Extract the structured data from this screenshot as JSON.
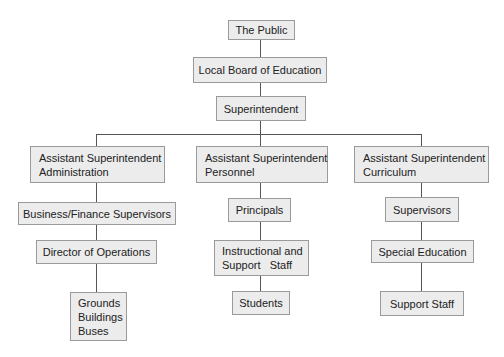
{
  "chart": {
    "title": "",
    "nodes": {
      "public": "The Public",
      "board": "Local Board of Education",
      "superintendent": "Superintendent",
      "asst_admin": {
        "line1": "Assistant Superintendent",
        "line2": "Administration"
      },
      "asst_personnel": {
        "line1": "Assistant Superintendent",
        "line2": "Personnel"
      },
      "asst_curriculum": {
        "line1": "Assistant Superintendent",
        "line2": "Curriculum"
      },
      "business_finance": "Business/Finance Supervisors",
      "director_operations": "Director of Operations",
      "grounds": {
        "line1": "Grounds",
        "line2": "Buildings",
        "line3": "Buses"
      },
      "principals": "Principals",
      "instructional": {
        "line1": "Instructional and",
        "line2": "Support   Staff"
      },
      "students": "Students",
      "supervisors": "Supervisors",
      "special_education": "Special Education",
      "support_staff": "Support Staff"
    },
    "colors": {
      "box_fill": "#ececec",
      "box_border": "#9a9a9a",
      "connector": "#555555"
    }
  }
}
